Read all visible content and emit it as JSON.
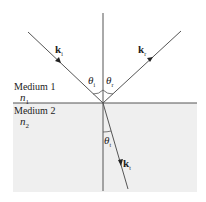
{
  "diagram": {
    "colors": {
      "line": "#555555",
      "medium2_fill": "#efefef",
      "background": "#ffffff",
      "text": "#222222"
    },
    "media": [
      {
        "name": "Medium 1",
        "index_symbol": "n",
        "index_sub": "1"
      },
      {
        "name": "Medium 2",
        "index_symbol": "n",
        "index_sub": "2"
      }
    ],
    "rays": {
      "incident": {
        "vector": "k",
        "sub": "i"
      },
      "reflected": {
        "vector": "k",
        "sub": "r"
      },
      "transmitted": {
        "vector": "k",
        "sub": "t"
      }
    },
    "angles": {
      "incident": {
        "symbol": "θ",
        "sub": "i"
      },
      "reflected": {
        "symbol": "θ",
        "sub": "r"
      },
      "transmitted": {
        "symbol": "θ",
        "sub": "t"
      }
    }
  }
}
